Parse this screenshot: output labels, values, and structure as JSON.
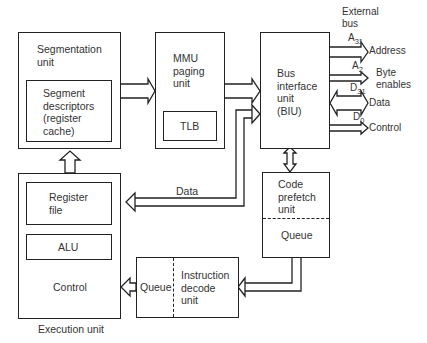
{
  "diagram": {
    "blocks": {
      "segmentation_unit": {
        "label": "Segmentation\nunit"
      },
      "segment_descriptors": {
        "label": "Segment\ndescriptors\n(register\ncache)"
      },
      "mmu_paging_unit": {
        "label": "MMU\npaging\nunit"
      },
      "tlb": {
        "label": "TLB"
      },
      "bus_interface_unit": {
        "label": "Bus\ninterface\nunit\n(BIU)"
      },
      "register_file": {
        "label": "Register\nfile"
      },
      "alu": {
        "label": "ALU"
      },
      "control": {
        "label": "Control"
      },
      "execution_unit": {
        "label": "Execution unit"
      },
      "code_prefetch_unit": {
        "label": "Code\nprefetch\nunit"
      },
      "prefetch_queue": {
        "label": "Queue"
      },
      "decode_queue": {
        "label": "Queue"
      },
      "instruction_decode_unit": {
        "label": "Instruction\ndecode\nunit"
      }
    },
    "external_bus": {
      "title": "External\nbus",
      "signals": [
        {
          "name": "Address",
          "top": "A",
          "top_sub": "31",
          "bottom": "A",
          "bottom_sub": "2"
        },
        {
          "name": "Byte\nenables"
        },
        {
          "name": "Data",
          "top": "D",
          "top_sub": "31",
          "bottom": "D",
          "bottom_sub": "0"
        },
        {
          "name": "Control"
        }
      ]
    },
    "connections": {
      "data_label": "Data"
    }
  }
}
